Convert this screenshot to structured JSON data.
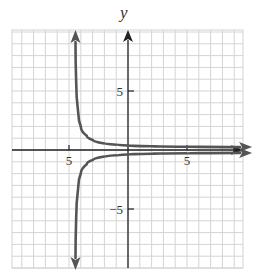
{
  "chart_data": {
    "type": "line",
    "title": "",
    "xlabel": "",
    "ylabel": "y",
    "xlim": [
      -10,
      10
    ],
    "ylim": [
      -10,
      10
    ],
    "grid": true,
    "grid_step": 1,
    "x_ticks": [
      {
        "value": -5,
        "label": "5"
      },
      {
        "value": 5,
        "label": "5"
      }
    ],
    "y_ticks": [
      {
        "value": 5,
        "label": "5"
      },
      {
        "value": -5,
        "label": "−5"
      }
    ],
    "vertical_asymptote": -4.5,
    "series": [
      {
        "name": "upper-branch",
        "points": [
          [
            -4.45,
            10
          ],
          [
            -4.4,
            6
          ],
          [
            -4.2,
            3
          ],
          [
            -4,
            2
          ],
          [
            -3.5,
            1.2
          ],
          [
            -3,
            0.85
          ],
          [
            -2,
            0.55
          ],
          [
            -1,
            0.45
          ],
          [
            0,
            0.38
          ],
          [
            2,
            0.32
          ],
          [
            5,
            0.28
          ],
          [
            9.5,
            0.25
          ]
        ]
      },
      {
        "name": "lower-branch",
        "points": [
          [
            -4.45,
            -10
          ],
          [
            -4.4,
            -6
          ],
          [
            -4.2,
            -3
          ],
          [
            -4,
            -2
          ],
          [
            -3.5,
            -1.2
          ],
          [
            -3,
            -0.85
          ],
          [
            -2,
            -0.55
          ],
          [
            -1,
            -0.45
          ],
          [
            0,
            -0.38
          ],
          [
            2,
            -0.32
          ],
          [
            5,
            -0.28
          ],
          [
            9.5,
            -0.25
          ]
        ]
      }
    ],
    "colors": {
      "grid": "#d4d4d4",
      "axis": "#222222",
      "curve": "#555555",
      "label": "#333333"
    }
  }
}
